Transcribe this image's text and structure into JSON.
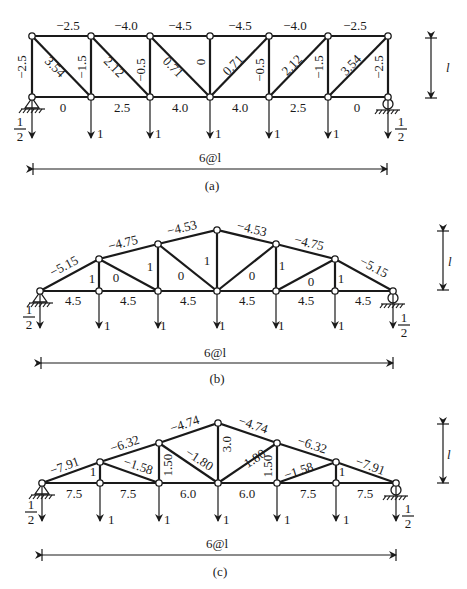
{
  "figure": {
    "panels": [
      {
        "caption": "(a)",
        "span_label": "6@l",
        "height_label": "l",
        "type": "parallel-chord Pratt truss",
        "top_chord": [
          "-2.5",
          "-4.0",
          "-4.5",
          "-4.5",
          "-4.0",
          "-2.5"
        ],
        "bottom_chord": [
          "0",
          "2.5",
          "4.0",
          "4.0",
          "2.5",
          "0"
        ],
        "verticals": [
          "-2.5",
          "-1.5",
          "-0.5",
          "0",
          "-0.5",
          "-1.5",
          "-2.5"
        ],
        "diagonals": [
          "3.54",
          "2.12",
          "0.71",
          "0.71",
          "2.12",
          "3.54"
        ],
        "loads": [
          "1",
          "1",
          "1",
          "1",
          "1"
        ],
        "reactions": {
          "left_num": "1",
          "left_den": "2",
          "right_num": "1",
          "right_den": "2"
        }
      },
      {
        "caption": "(b)",
        "span_label": "6@l",
        "height_label": "l",
        "type": "parabolic bowstring truss",
        "top_chord": [
          "-5.15",
          "-4.75",
          "-4.53",
          "-4.53",
          "-4.75",
          "-5.15"
        ],
        "bottom_chord": [
          "4.5",
          "4.5",
          "4.5",
          "4.5",
          "4.5",
          "4.5"
        ],
        "verticals": [
          "1",
          "1",
          "1",
          "1",
          "1"
        ],
        "diagonals": [
          "0",
          "0",
          "0",
          "0"
        ],
        "loads": [
          "1",
          "1",
          "1",
          "1",
          "1"
        ],
        "reactions": {
          "left_num": "1",
          "left_den": "2",
          "right_num": "1",
          "right_den": "2"
        }
      },
      {
        "caption": "(c)",
        "span_label": "6@l",
        "height_label": "l",
        "type": "triangular truss",
        "top_chord": [
          "-7.91",
          "-6.32",
          "-4.74",
          "-4.74",
          "-6.32",
          "-7.91"
        ],
        "bottom_chord": [
          "7.5",
          "7.5",
          "6.0",
          "6.0",
          "7.5",
          "7.5"
        ],
        "verticals": [
          "1",
          "1.50",
          "3.0",
          "1.50",
          "1"
        ],
        "diagonals": [
          "-1.58",
          "-1.80",
          "-1.80",
          "-1.58"
        ],
        "loads": [
          "1",
          "1",
          "1",
          "1",
          "1"
        ],
        "reactions": {
          "left_num": "1",
          "left_den": "2",
          "right_num": "1",
          "right_den": "2"
        }
      }
    ]
  }
}
